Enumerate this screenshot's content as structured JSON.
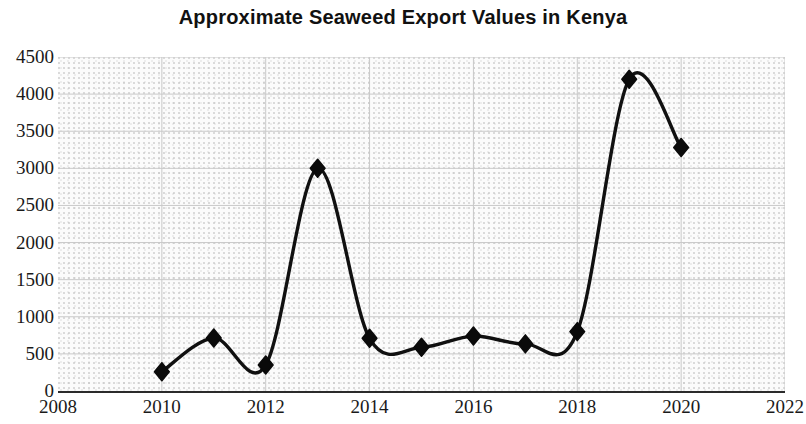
{
  "chart_data": {
    "type": "line",
    "title": "Approximate Seaweed Export Values in Kenya",
    "xlabel": "",
    "ylabel": "",
    "x": [
      2010,
      2011,
      2012,
      2013,
      2014,
      2015,
      2016,
      2017,
      2018,
      2019,
      2020
    ],
    "values": [
      260,
      715,
      350,
      3000,
      710,
      590,
      740,
      635,
      800,
      4200,
      3280
    ],
    "series": [
      {
        "name": "Approximate Seaweed Export Values",
        "values": [
          260,
          715,
          350,
          3000,
          710,
          590,
          740,
          635,
          800,
          4200,
          3280
        ]
      }
    ],
    "xlim": [
      2008,
      2022
    ],
    "ylim": [
      0,
      4500
    ],
    "x_ticks": [
      2008,
      2010,
      2012,
      2014,
      2016,
      2018,
      2020,
      2022
    ],
    "x_tick_labels": [
      "2008",
      "2010",
      "2012",
      "2014",
      "2016",
      "2018",
      "2020",
      "2022"
    ],
    "y_ticks": [
      0,
      500,
      1000,
      1500,
      2000,
      2500,
      3000,
      3500,
      4000,
      4500
    ],
    "y_tick_labels": [
      "0",
      "500",
      "1000",
      "1500",
      "2000",
      "2500",
      "3000",
      "3500",
      "4000",
      "4500"
    ],
    "grid": true,
    "grid_color": "#c9c9c9",
    "legend": false,
    "legend_position": "none",
    "line_color": "#101010",
    "line_width": 3.4,
    "marker": "diamond",
    "marker_color": "#0a0a0a",
    "marker_size": 9,
    "smooth": true,
    "plot_background": "#fbfbfb",
    "axis_color": "#2b2b2b"
  }
}
